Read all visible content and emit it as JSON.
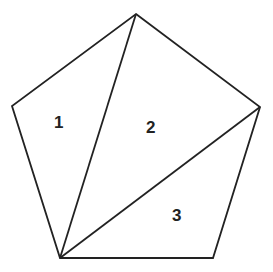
{
  "diagram": {
    "type": "pentagon-triangulation",
    "stroke_color": "#222222",
    "background": "#ffffff",
    "vertices": {
      "top": [
        136,
        14
      ],
      "left": [
        12,
        106
      ],
      "right": [
        260,
        107
      ],
      "bottom_left": [
        60,
        258
      ],
      "bottom_right": [
        213,
        258
      ]
    },
    "regions": [
      {
        "label": "1",
        "x": 61,
        "y": 128
      },
      {
        "label": "2",
        "x": 152,
        "y": 133
      },
      {
        "label": "3",
        "x": 178,
        "y": 221
      }
    ]
  }
}
